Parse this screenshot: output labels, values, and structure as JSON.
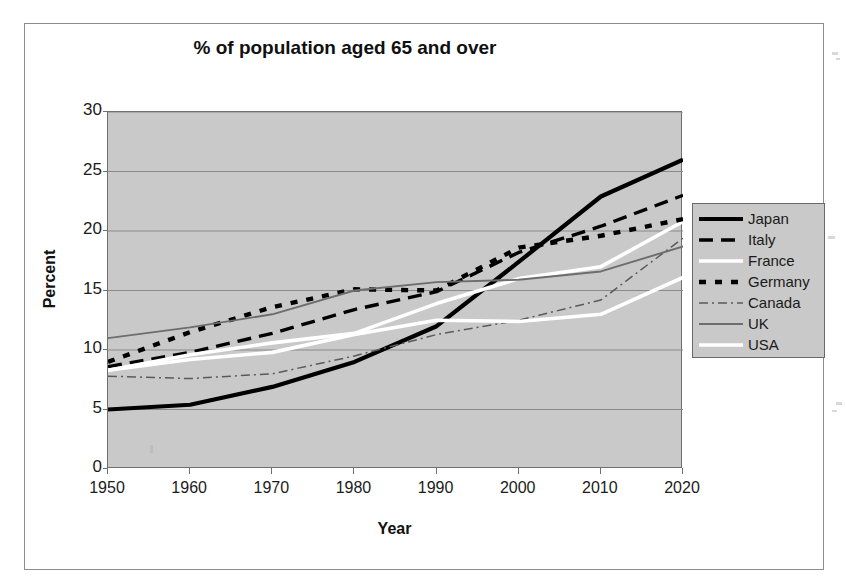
{
  "chart_data": {
    "type": "line",
    "title": "% of population aged 65 and over",
    "xlabel": "Year",
    "ylabel": "Percent",
    "x": [
      1950,
      1960,
      1970,
      1980,
      1990,
      2000,
      2010,
      2020
    ],
    "categories": [
      "1950",
      "1960",
      "1970",
      "1980",
      "1990",
      "2000",
      "2010",
      "2020"
    ],
    "xlim": [
      1950,
      2020
    ],
    "ylim": [
      0,
      30
    ],
    "yticks": [
      0,
      5,
      10,
      15,
      20,
      25,
      30
    ],
    "grid": true,
    "legend_position": "right",
    "series": [
      {
        "name": "Japan",
        "color": "#000000",
        "style": "solid-thick",
        "values": [
          5.0,
          5.4,
          6.9,
          9.0,
          12.0,
          17.4,
          22.9,
          26.0
        ]
      },
      {
        "name": "Italy",
        "color": "#000000",
        "style": "dashed",
        "values": [
          8.6,
          9.8,
          11.4,
          13.4,
          14.9,
          18.2,
          20.4,
          23.0
        ]
      },
      {
        "name": "France",
        "color": "#ffffff",
        "style": "solid-white",
        "values": [
          8.3,
          9.6,
          10.6,
          11.4,
          13.9,
          16.0,
          17.0,
          20.8
        ]
      },
      {
        "name": "Germany",
        "color": "#000000",
        "style": "dotted-thick",
        "values": [
          9.0,
          11.5,
          13.6,
          15.1,
          15.0,
          18.6,
          19.6,
          21.0
        ]
      },
      {
        "name": "Canada",
        "color": "#5a5a5a",
        "style": "dash-dot",
        "values": [
          7.8,
          7.6,
          8.0,
          9.5,
          11.3,
          12.5,
          14.2,
          19.4
        ]
      },
      {
        "name": "UK",
        "color": "#6d6d6d",
        "style": "solid-thin",
        "values": [
          11.0,
          11.9,
          13.0,
          15.0,
          15.7,
          15.9,
          16.6,
          18.7
        ]
      },
      {
        "name": "USA",
        "color": "#ffffff",
        "style": "solid-white",
        "values": [
          8.3,
          9.2,
          9.8,
          11.3,
          12.5,
          12.4,
          13.0,
          16.1
        ]
      }
    ]
  },
  "legend": {
    "items": [
      {
        "label": "Japan"
      },
      {
        "label": "Italy"
      },
      {
        "label": "France"
      },
      {
        "label": "Germany"
      },
      {
        "label": "Canada"
      },
      {
        "label": "UK"
      },
      {
        "label": "USA"
      }
    ]
  },
  "axes": {
    "y_title": "Percent",
    "x_title": "Year",
    "y_tick_labels": [
      "30",
      "25",
      "20",
      "15",
      "10",
      "5",
      "0"
    ],
    "x_tick_labels": [
      "1950",
      "1960",
      "1970",
      "1980",
      "1990",
      "2000",
      "2010",
      "2020"
    ]
  },
  "colors": {
    "plot_background": "#c9c9c9",
    "page_background": "#ffffff",
    "grid": "#8a8a8a",
    "axis": "#6f6f6f",
    "text": "#1b1b1b"
  }
}
